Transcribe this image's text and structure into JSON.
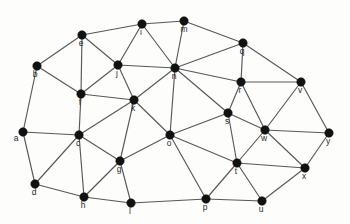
{
  "figure": {
    "background_color": "#fdfdfc",
    "edge_color": "#58585a",
    "vertex_color": "#121212",
    "label_color": "#2a2a2a",
    "width": 350,
    "height": 224
  },
  "graph_data": {
    "type": "node-link-diagram",
    "directed": false,
    "weighted": false,
    "vertex_count": 25,
    "edge_count": 57,
    "vertices": [
      {
        "id": "a",
        "label": "a",
        "x": 23,
        "y": 132,
        "label_dx": -7,
        "label_dy": 7
      },
      {
        "id": "b",
        "label": "b",
        "x": 37,
        "y": 66,
        "label_dx": -2,
        "label_dy": 9
      },
      {
        "id": "c",
        "label": "c",
        "x": 79,
        "y": 135,
        "label_dx": -1,
        "label_dy": 9
      },
      {
        "id": "d",
        "label": "d",
        "x": 35,
        "y": 184,
        "label_dx": -1,
        "label_dy": 9
      },
      {
        "id": "e",
        "label": "e",
        "x": 82,
        "y": 35,
        "label_dx": -1,
        "label_dy": 9
      },
      {
        "id": "f",
        "label": "f",
        "x": 81,
        "y": 94,
        "label_dx": -1,
        "label_dy": 9
      },
      {
        "id": "g",
        "label": "g",
        "x": 120,
        "y": 161,
        "label_dx": -1,
        "label_dy": 9
      },
      {
        "id": "h",
        "label": "h",
        "x": 84,
        "y": 197,
        "label_dx": -1,
        "label_dy": 9
      },
      {
        "id": "i",
        "label": "i",
        "x": 142,
        "y": 24,
        "label_dx": -1,
        "label_dy": 9
      },
      {
        "id": "j",
        "label": "j",
        "x": 118,
        "y": 65,
        "label_dx": -1,
        "label_dy": 9
      },
      {
        "id": "k",
        "label": "k",
        "x": 134,
        "y": 100,
        "label_dx": -1,
        "label_dy": 9
      },
      {
        "id": "l",
        "label": "l",
        "x": 131,
        "y": 203,
        "label_dx": -1,
        "label_dy": 9
      },
      {
        "id": "m",
        "label": "m",
        "x": 184,
        "y": 21,
        "label_dx": 0,
        "label_dy": 9
      },
      {
        "id": "n",
        "label": "n",
        "x": 175,
        "y": 68,
        "label_dx": -1,
        "label_dy": 9
      },
      {
        "id": "o",
        "label": "o",
        "x": 170,
        "y": 135,
        "label_dx": -1,
        "label_dy": 9
      },
      {
        "id": "p",
        "label": "p",
        "x": 206,
        "y": 199,
        "label_dx": -1,
        "label_dy": 9
      },
      {
        "id": "q",
        "label": "q",
        "x": 243,
        "y": 43,
        "label_dx": -1,
        "label_dy": 9
      },
      {
        "id": "r",
        "label": "r",
        "x": 241,
        "y": 82,
        "label_dx": -1,
        "label_dy": 9
      },
      {
        "id": "s",
        "label": "s",
        "x": 228,
        "y": 113,
        "label_dx": -1,
        "label_dy": 9
      },
      {
        "id": "t",
        "label": "t",
        "x": 237,
        "y": 163,
        "label_dx": -1,
        "label_dy": 9
      },
      {
        "id": "u",
        "label": "u",
        "x": 262,
        "y": 201,
        "label_dx": -1,
        "label_dy": 9
      },
      {
        "id": "v",
        "label": "v",
        "x": 301,
        "y": 82,
        "label_dx": -1,
        "label_dy": 9
      },
      {
        "id": "w",
        "label": "w",
        "x": 265,
        "y": 130,
        "label_dx": -1,
        "label_dy": 9
      },
      {
        "id": "x",
        "label": "x",
        "x": 305,
        "y": 168,
        "label_dx": -1,
        "label_dy": 9
      },
      {
        "id": "y",
        "label": "y",
        "x": 329,
        "y": 133,
        "label_dx": -1,
        "label_dy": 9
      }
    ],
    "edges": [
      [
        "a",
        "b"
      ],
      [
        "a",
        "c"
      ],
      [
        "a",
        "d"
      ],
      [
        "b",
        "e"
      ],
      [
        "b",
        "f"
      ],
      [
        "c",
        "f"
      ],
      [
        "c",
        "d"
      ],
      [
        "c",
        "g"
      ],
      [
        "c",
        "h"
      ],
      [
        "c",
        "k"
      ],
      [
        "d",
        "h"
      ],
      [
        "e",
        "f"
      ],
      [
        "e",
        "i"
      ],
      [
        "e",
        "j"
      ],
      [
        "f",
        "j"
      ],
      [
        "f",
        "k"
      ],
      [
        "g",
        "h"
      ],
      [
        "g",
        "k"
      ],
      [
        "g",
        "l"
      ],
      [
        "g",
        "o"
      ],
      [
        "h",
        "l"
      ],
      [
        "i",
        "j"
      ],
      [
        "i",
        "m"
      ],
      [
        "i",
        "n"
      ],
      [
        "j",
        "k"
      ],
      [
        "j",
        "n"
      ],
      [
        "k",
        "n"
      ],
      [
        "k",
        "o"
      ],
      [
        "l",
        "p"
      ],
      [
        "m",
        "n"
      ],
      [
        "m",
        "q"
      ],
      [
        "n",
        "o"
      ],
      [
        "n",
        "q"
      ],
      [
        "n",
        "r"
      ],
      [
        "n",
        "s"
      ],
      [
        "o",
        "p"
      ],
      [
        "o",
        "s"
      ],
      [
        "o",
        "t"
      ],
      [
        "p",
        "t"
      ],
      [
        "p",
        "u"
      ],
      [
        "q",
        "r"
      ],
      [
        "q",
        "v"
      ],
      [
        "r",
        "s"
      ],
      [
        "r",
        "v"
      ],
      [
        "r",
        "w"
      ],
      [
        "s",
        "t"
      ],
      [
        "s",
        "w"
      ],
      [
        "t",
        "u"
      ],
      [
        "t",
        "w"
      ],
      [
        "t",
        "x"
      ],
      [
        "u",
        "x"
      ],
      [
        "v",
        "w"
      ],
      [
        "v",
        "y"
      ],
      [
        "w",
        "x"
      ],
      [
        "w",
        "y"
      ],
      [
        "x",
        "y"
      ]
    ]
  }
}
